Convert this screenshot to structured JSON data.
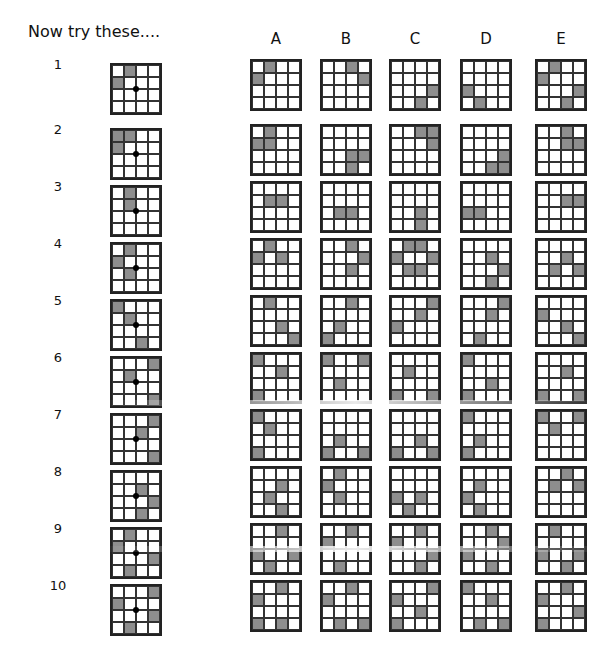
{
  "title": "Now try these....",
  "columns": [
    "A",
    "B",
    "C",
    "D",
    "E"
  ],
  "colors": {
    "shaded": "#8e8e8e",
    "grid_line": "#222222"
  },
  "rows": [
    {
      "label": "1",
      "question": [
        [
          0,
          1
        ],
        [
          1,
          0
        ]
      ],
      "options": {
        "A": [
          [
            0,
            1
          ],
          [
            1,
            0
          ]
        ],
        "B": [
          [
            0,
            2
          ],
          [
            1,
            3
          ]
        ],
        "C": [
          [
            2,
            3
          ],
          [
            3,
            2
          ]
        ],
        "D": [
          [
            2,
            0
          ],
          [
            3,
            1
          ]
        ],
        "E": [
          [
            0,
            1
          ],
          [
            1,
            0
          ],
          [
            2,
            3
          ],
          [
            3,
            2
          ]
        ]
      }
    },
    {
      "label": "2",
      "question": [
        [
          0,
          0
        ],
        [
          0,
          1
        ],
        [
          1,
          0
        ]
      ],
      "options": {
        "A": [
          [
            0,
            1
          ],
          [
            1,
            0
          ],
          [
            1,
            1
          ]
        ],
        "B": [
          [
            2,
            2
          ],
          [
            2,
            3
          ],
          [
            3,
            2
          ]
        ],
        "C": [
          [
            0,
            2
          ],
          [
            0,
            3
          ],
          [
            1,
            3
          ]
        ],
        "D": [
          [
            2,
            3
          ],
          [
            3,
            2
          ],
          [
            3,
            3
          ]
        ],
        "E": [
          [
            0,
            2
          ],
          [
            1,
            2
          ],
          [
            1,
            3
          ]
        ]
      }
    },
    {
      "label": "3",
      "question": [
        [
          0,
          1
        ],
        [
          1,
          1
        ]
      ],
      "options": {
        "A": [
          [
            1,
            1
          ],
          [
            1,
            2
          ]
        ],
        "B": [
          [
            2,
            1
          ],
          [
            2,
            2
          ]
        ],
        "C": [
          [
            2,
            2
          ],
          [
            3,
            2
          ]
        ],
        "D": [
          [
            2,
            0
          ],
          [
            2,
            1
          ]
        ],
        "E": [
          [
            1,
            2
          ],
          [
            1,
            3
          ]
        ]
      }
    },
    {
      "label": "4",
      "question": [
        [
          0,
          1
        ],
        [
          1,
          0
        ],
        [
          2,
          1
        ]
      ],
      "options": {
        "A": [
          [
            0,
            1
          ],
          [
            1,
            0
          ],
          [
            1,
            2
          ]
        ],
        "B": [
          [
            0,
            2
          ],
          [
            1,
            3
          ],
          [
            2,
            2
          ]
        ],
        "C": [
          [
            0,
            1
          ],
          [
            0,
            2
          ],
          [
            1,
            0
          ],
          [
            1,
            3
          ],
          [
            2,
            1
          ],
          [
            2,
            2
          ]
        ],
        "D": [
          [
            1,
            2
          ],
          [
            2,
            3
          ],
          [
            3,
            2
          ]
        ],
        "E": [
          [
            1,
            2
          ],
          [
            2,
            1
          ],
          [
            2,
            3
          ]
        ]
      }
    },
    {
      "label": "5",
      "question": [
        [
          0,
          0
        ],
        [
          1,
          1
        ],
        [
          3,
          2
        ]
      ],
      "options": {
        "A": [
          [
            0,
            1
          ],
          [
            2,
            2
          ],
          [
            3,
            3
          ]
        ],
        "B": [
          [
            0,
            2
          ],
          [
            2,
            1
          ],
          [
            3,
            0
          ]
        ],
        "C": [
          [
            0,
            3
          ],
          [
            1,
            2
          ],
          [
            2,
            0
          ]
        ],
        "D": [
          [
            0,
            3
          ],
          [
            1,
            2
          ],
          [
            3,
            1
          ]
        ],
        "E": [
          [
            1,
            0
          ],
          [
            2,
            2
          ],
          [
            3,
            3
          ]
        ]
      }
    },
    {
      "label": "6",
      "question": [
        [
          0,
          3
        ],
        [
          1,
          1
        ],
        [
          3,
          3
        ]
      ],
      "options": {
        "A": [
          [
            0,
            0
          ],
          [
            1,
            2
          ],
          [
            3,
            0
          ]
        ],
        "B": [
          [
            0,
            0
          ],
          [
            0,
            3
          ],
          [
            2,
            1
          ]
        ],
        "C": [
          [
            1,
            1
          ],
          [
            3,
            0
          ],
          [
            3,
            3
          ]
        ],
        "D": [
          [
            0,
            0
          ],
          [
            2,
            2
          ],
          [
            3,
            0
          ]
        ],
        "E": [
          [
            1,
            2
          ],
          [
            3,
            0
          ],
          [
            3,
            3
          ]
        ]
      }
    },
    {
      "label": "7",
      "question": [
        [
          0,
          3
        ],
        [
          1,
          2
        ],
        [
          3,
          3
        ]
      ],
      "options": {
        "A": [
          [
            0,
            0
          ],
          [
            1,
            1
          ],
          [
            3,
            0
          ]
        ],
        "B": [
          [
            2,
            1
          ],
          [
            3,
            0
          ],
          [
            3,
            3
          ]
        ],
        "C": [
          [
            2,
            2
          ],
          [
            3,
            0
          ],
          [
            3,
            3
          ]
        ],
        "D": [
          [
            0,
            0
          ],
          [
            2,
            1
          ],
          [
            3,
            0
          ]
        ],
        "E": [
          [
            0,
            0
          ],
          [
            0,
            3
          ],
          [
            1,
            1
          ]
        ]
      }
    },
    {
      "label": "8",
      "question": [
        [
          1,
          2
        ],
        [
          2,
          3
        ],
        [
          3,
          2
        ]
      ],
      "options": {
        "A": [
          [
            1,
            2
          ],
          [
            2,
            1
          ],
          [
            3,
            2
          ]
        ],
        "B": [
          [
            0,
            1
          ],
          [
            1,
            0
          ],
          [
            2,
            1
          ]
        ],
        "C": [
          [
            2,
            0
          ],
          [
            2,
            2
          ],
          [
            3,
            1
          ]
        ],
        "D": [
          [
            1,
            1
          ],
          [
            2,
            0
          ],
          [
            3,
            1
          ]
        ],
        "E": [
          [
            0,
            2
          ],
          [
            1,
            1
          ],
          [
            1,
            3
          ]
        ]
      }
    },
    {
      "label": "9",
      "question": [
        [
          0,
          1
        ],
        [
          1,
          0
        ],
        [
          2,
          3
        ],
        [
          3,
          1
        ]
      ],
      "options": {
        "A": [
          [
            0,
            2
          ],
          [
            2,
            0
          ],
          [
            2,
            3
          ],
          [
            3,
            1
          ]
        ],
        "B": [
          [
            0,
            2
          ],
          [
            1,
            0
          ],
          [
            3,
            1
          ]
        ],
        "C": [
          [
            0,
            2
          ],
          [
            1,
            0
          ],
          [
            2,
            3
          ],
          [
            3,
            2
          ]
        ],
        "D": [
          [
            0,
            2
          ],
          [
            1,
            3
          ],
          [
            2,
            0
          ],
          [
            3,
            2
          ]
        ],
        "E": [
          [
            0,
            1
          ],
          [
            2,
            0
          ],
          [
            2,
            3
          ],
          [
            3,
            2
          ]
        ]
      }
    },
    {
      "label": "10",
      "question": [
        [
          0,
          3
        ],
        [
          1,
          0
        ],
        [
          2,
          3
        ],
        [
          3,
          1
        ]
      ],
      "options": {
        "A": [
          [
            0,
            2
          ],
          [
            1,
            0
          ],
          [
            3,
            0
          ],
          [
            3,
            2
          ]
        ],
        "B": [
          [
            0,
            2
          ],
          [
            1,
            0
          ],
          [
            3,
            1
          ],
          [
            3,
            3
          ]
        ],
        "C": [
          [
            0,
            3
          ],
          [
            1,
            0
          ],
          [
            2,
            2
          ],
          [
            3,
            0
          ]
        ],
        "D": [
          [
            0,
            0
          ],
          [
            1,
            2
          ],
          [
            3,
            1
          ],
          [
            3,
            3
          ]
        ],
        "E": [
          [
            0,
            2
          ],
          [
            1,
            0
          ],
          [
            2,
            3
          ],
          [
            3,
            0
          ]
        ]
      }
    }
  ]
}
